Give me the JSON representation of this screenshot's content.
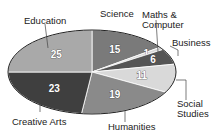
{
  "chart_data": {
    "type": "pie",
    "title": "",
    "categories": [
      "Science",
      "Maths & Computer",
      "Business",
      "Social Studies",
      "Humanities",
      "Creative Arts",
      "Education"
    ],
    "values": [
      15,
      1,
      6,
      11,
      19,
      23,
      25
    ],
    "colors": [
      "#7a7a7a",
      "#d8d8d8",
      "#555555",
      "#d9d9d9",
      "#8a8a8a",
      "#3f3f3f",
      "#a9a9a9"
    ],
    "start_angle_deg": 0,
    "direction": "clockwise",
    "legend": "callout labels",
    "total": 100
  },
  "labels": {
    "science": "Science",
    "maths1": "Maths &",
    "maths2": "Computer",
    "business": "Business",
    "social1": "Social",
    "social2": "Studies",
    "humanities": "Humanities",
    "creative": "Creative Arts",
    "education": "Education"
  }
}
